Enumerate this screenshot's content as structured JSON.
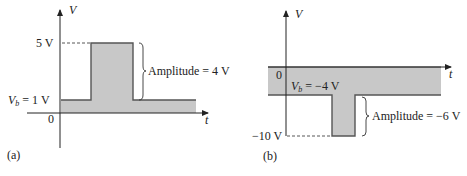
{
  "panels": [
    {
      "id": "a",
      "caption": "(a)",
      "y_axis_label": "V",
      "x_axis_label": "t",
      "origin_label": "0",
      "peak_label": "5 V",
      "base_label_sym": "V",
      "base_label_sub": "b",
      "base_label_value": " = 1 V",
      "amplitude_label": "Amplitude = 4 V",
      "base_voltage": 1,
      "peak_voltage": 5,
      "amplitude": 4
    },
    {
      "id": "b",
      "caption": "(b)",
      "y_axis_label": "V",
      "x_axis_label": "t",
      "origin_label": "0",
      "peak_label": "−10 V",
      "base_label_sym": "V",
      "base_label_sub": "b",
      "base_label_value": " = −4 V",
      "amplitude_label": "Amplitude = −6 V",
      "base_voltage": -4,
      "peak_voltage": -10,
      "amplitude": -6
    }
  ],
  "colors": {
    "fill": "#c8c8c8",
    "line": "#555555",
    "axis": "#222222"
  }
}
